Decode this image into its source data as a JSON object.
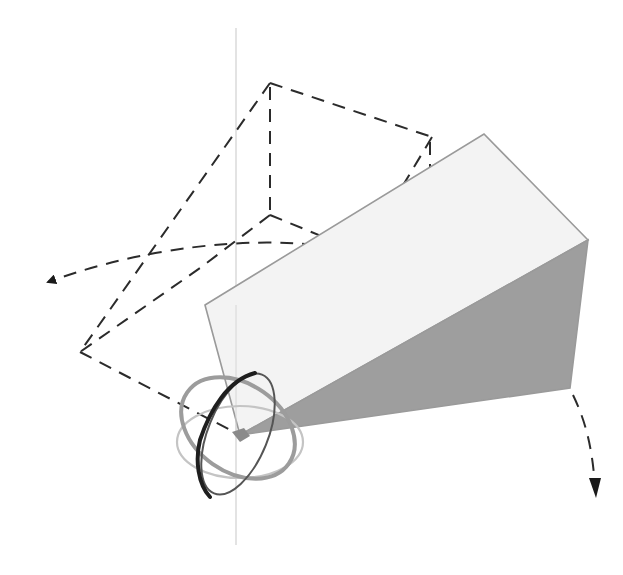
{
  "diagram": {
    "colors": {
      "background": "#ffffff",
      "dashed_lines": "#2b2b2b",
      "vertical_axis": "#d4d4d4",
      "wedge_light_face": "#f3f3f3",
      "wedge_dark_face": "#9e9e9e",
      "wedge_edges": "#9a9a9a",
      "gizmo_ring_dark": "#222222",
      "gizmo_ring_mid": "#9c9c9c",
      "gizmo_ring_light": "#c4c4c4",
      "pivot": "#8a8a8a"
    },
    "elements": [
      {
        "id": "vertical-axis",
        "type": "line"
      },
      {
        "id": "dashed-box-wireframe",
        "type": "dashed-outline"
      },
      {
        "id": "rotation-arc-left",
        "type": "dashed-arrow",
        "direction": "left"
      },
      {
        "id": "rotation-arc-right",
        "type": "dashed-arrow",
        "direction": "down"
      },
      {
        "id": "solid-wedge",
        "type": "shaded-polygon"
      },
      {
        "id": "rotation-gizmo",
        "type": "three-ring-gizmo"
      }
    ]
  }
}
